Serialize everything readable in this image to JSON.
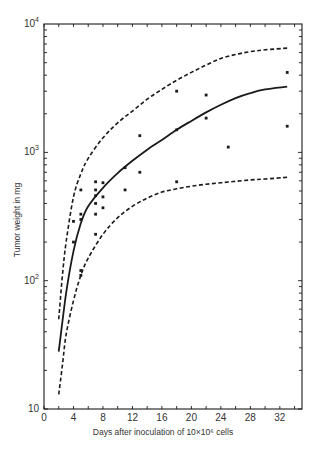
{
  "chart_data": {
    "type": "scatter",
    "title": "",
    "xlabel": "Days after inoculation of 10×10⁶ cells",
    "ylabel": "Tumor weight in mg",
    "xlim": [
      0,
      35
    ],
    "ylim": [
      10,
      10000
    ],
    "yscale": "log",
    "grid": false,
    "legend": null,
    "x_ticks": [
      0,
      4,
      8,
      12,
      16,
      20,
      24,
      28,
      32
    ],
    "x_tick_labels": [
      "0",
      "4",
      "8",
      "12",
      "16",
      "20",
      "24",
      "28",
      "32"
    ],
    "y_ticks": [
      10,
      100,
      1000,
      10000
    ],
    "y_tick_labels": [
      "10",
      "10²",
      "10³",
      "10⁴"
    ],
    "series": [
      {
        "name": "observed tumor weights",
        "kind": "points",
        "points": [
          [
            4,
            200
          ],
          [
            4,
            290
          ],
          [
            5,
            110
          ],
          [
            5,
            120
          ],
          [
            5,
            300
          ],
          [
            5,
            330
          ],
          [
            5,
            510
          ],
          [
            7,
            230
          ],
          [
            7,
            330
          ],
          [
            7,
            400
          ],
          [
            7,
            460
          ],
          [
            7,
            510
          ],
          [
            7,
            590
          ],
          [
            8,
            370
          ],
          [
            8,
            450
          ],
          [
            8,
            580
          ],
          [
            11,
            510
          ],
          [
            11,
            760
          ],
          [
            13,
            700
          ],
          [
            13,
            1350
          ],
          [
            18,
            590
          ],
          [
            18,
            1500
          ],
          [
            18,
            3000
          ],
          [
            22,
            1850
          ],
          [
            22,
            2800
          ],
          [
            25,
            1100
          ],
          [
            33,
            1600
          ],
          [
            33,
            4200
          ]
        ]
      },
      {
        "name": "mean growth curve",
        "kind": "solid-line",
        "points": [
          [
            2,
            28
          ],
          [
            3,
            80
          ],
          [
            4,
            170
          ],
          [
            5,
            280
          ],
          [
            6,
            380
          ],
          [
            8,
            530
          ],
          [
            10,
            690
          ],
          [
            12,
            860
          ],
          [
            14,
            1050
          ],
          [
            16,
            1250
          ],
          [
            18,
            1500
          ],
          [
            20,
            1760
          ],
          [
            22,
            2050
          ],
          [
            24,
            2350
          ],
          [
            26,
            2650
          ],
          [
            28,
            2900
          ],
          [
            30,
            3100
          ],
          [
            33,
            3250
          ]
        ]
      },
      {
        "name": "upper confidence limit",
        "kind": "dashed-line",
        "points": [
          [
            2,
            50
          ],
          [
            2.5,
            110
          ],
          [
            3,
            200
          ],
          [
            4,
            450
          ],
          [
            5,
            680
          ],
          [
            6,
            900
          ],
          [
            8,
            1300
          ],
          [
            10,
            1700
          ],
          [
            12,
            2100
          ],
          [
            14,
            2600
          ],
          [
            16,
            3100
          ],
          [
            18,
            3650
          ],
          [
            20,
            4200
          ],
          [
            22,
            4800
          ],
          [
            24,
            5400
          ],
          [
            26,
            5800
          ],
          [
            28,
            6100
          ],
          [
            30,
            6300
          ],
          [
            33,
            6500
          ]
        ]
      },
      {
        "name": "lower confidence limit",
        "kind": "dashed-line",
        "points": [
          [
            2,
            13
          ],
          [
            2.5,
            22
          ],
          [
            3,
            38
          ],
          [
            4,
            70
          ],
          [
            5,
            110
          ],
          [
            6,
            150
          ],
          [
            8,
            230
          ],
          [
            10,
            310
          ],
          [
            12,
            380
          ],
          [
            14,
            440
          ],
          [
            16,
            490
          ],
          [
            18,
            520
          ],
          [
            20,
            545
          ],
          [
            22,
            565
          ],
          [
            24,
            580
          ],
          [
            26,
            595
          ],
          [
            28,
            610
          ],
          [
            30,
            620
          ],
          [
            33,
            640
          ]
        ]
      }
    ]
  },
  "axes": {
    "x_title": "Days after inoculation of 10×10⁶ cells",
    "y_title": "Tumor weight in mg"
  },
  "layout": {
    "plot_left": 44,
    "plot_right": 302,
    "plot_top": 24,
    "plot_bottom": 409,
    "px_per_day": 7.37,
    "px_per_decade": 128.3,
    "ink_color": "#1a1a1a"
  }
}
